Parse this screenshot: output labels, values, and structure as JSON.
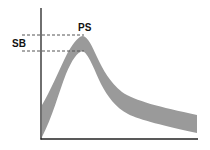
{
  "diagram": {
    "labels": {
      "peak": "PS",
      "level": "SB"
    },
    "colors": {
      "band": "#9a9a9a",
      "axis": "#222222",
      "dash": "#555555",
      "text": "#111111"
    },
    "axes": {
      "x_axis": {
        "from": [
          41,
          139
        ],
        "to": [
          198,
          139
        ]
      },
      "y_axis": {
        "from": [
          41,
          8
        ],
        "to": [
          41,
          139
        ]
      }
    },
    "dashed_lines": [
      {
        "name": "upper",
        "y": 35,
        "x1": 22,
        "x2": 84
      },
      {
        "name": "lower",
        "y": 51,
        "x1": 22,
        "x2": 84
      }
    ],
    "band": {
      "outer_edge": [
        [
          42,
          105
        ],
        [
          55,
          80
        ],
        [
          68,
          52
        ],
        [
          83,
          36
        ],
        [
          96,
          55
        ],
        [
          110,
          80
        ],
        [
          130,
          98
        ],
        [
          160,
          106
        ],
        [
          197,
          115
        ]
      ],
      "inner_edge": [
        [
          197,
          133
        ],
        [
          160,
          124
        ],
        [
          130,
          115
        ],
        [
          108,
          98
        ],
        [
          95,
          70
        ],
        [
          83,
          51
        ],
        [
          72,
          62
        ],
        [
          60,
          95
        ],
        [
          48,
          125
        ],
        [
          42,
          137
        ]
      ]
    }
  }
}
